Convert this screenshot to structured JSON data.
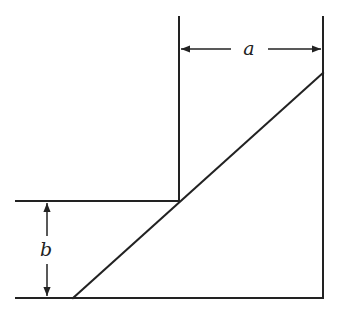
{
  "diagram": {
    "type": "geometry-figure",
    "labels": {
      "a": "a",
      "b": "b"
    },
    "dimensions": [
      {
        "name": "a",
        "orientation": "horizontal",
        "description": "width between left and right vertical walls"
      },
      {
        "name": "b",
        "orientation": "vertical",
        "description": "height of step above base"
      }
    ],
    "colors": {
      "stroke": "#222222",
      "background": "#ffffff"
    }
  }
}
